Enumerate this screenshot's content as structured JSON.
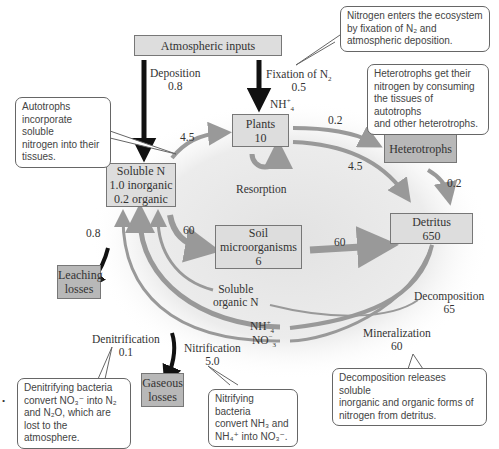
{
  "colors": {
    "box_fill": "#dddddd",
    "box_dark_fill": "#b8b8b8",
    "box_border": "#777777",
    "flow_gray": "#999999",
    "flow_black": "#111111",
    "glow": "#e6e6e6"
  },
  "boxes": {
    "atmospheric": {
      "label": "Atmospheric inputs"
    },
    "plants": {
      "line1": "Plants",
      "line2": "10"
    },
    "heterotrophs": {
      "label": "Heterotrophs"
    },
    "soluble_n": {
      "line1": "Soluble N",
      "line2": "1.0 inorganic",
      "line3": "0.2 organic"
    },
    "soil_micro": {
      "line1": "Soil",
      "line2": "microorganisms",
      "line3": "6"
    },
    "detritus": {
      "line1": "Detritus",
      "line2": "650"
    },
    "leaching": {
      "line1": "Leaching",
      "line2": "losses"
    },
    "gaseous": {
      "line1": "Gaseous",
      "line2": "losses"
    }
  },
  "flows": {
    "deposition": {
      "name": "Deposition",
      "value": "0.8"
    },
    "fixation": {
      "name": "Fixation of N",
      "sub": "2",
      "value": "0.5"
    },
    "nh4_label": {
      "text": "NH",
      "sub": "4",
      "sup": "+"
    },
    "soluble_to_plants": "4.5",
    "plants_to_heterotrophs": "0.2",
    "plants_to_detritus": "4.5",
    "heterotrophs_to_detritus": "0.2",
    "resorption": "Resorption",
    "soluble_to_soil": "60",
    "soil_to_detritus": "60",
    "leaching": "0.8",
    "soluble_organic": {
      "line1": "Soluble",
      "line2": "organic N"
    },
    "nh4": {
      "text": "NH",
      "sub": "4",
      "sup": "+"
    },
    "no3": {
      "text": "NO",
      "sub": "3",
      "sup": "−"
    },
    "decomposition": {
      "name": "Decomposition",
      "value": "65"
    },
    "mineralization": {
      "name": "Mineralization",
      "value": "60"
    },
    "denitrification": {
      "name": "Denitrification",
      "value": "0.1"
    },
    "nitrification": {
      "name": "Nitrification",
      "value": "5.0"
    }
  },
  "callouts": {
    "nitrogen_enters": {
      "lines": [
        "Nitrogen enters the ecosystem",
        "by fixation of N₂ and",
        "atmospheric deposition."
      ]
    },
    "heterotrophs": {
      "lines": [
        "Heterotrophs get their",
        "nitrogen by consuming",
        "the tissues of autotrophs",
        "and other heterotrophs."
      ]
    },
    "autotrophs": {
      "lines": [
        "Autotrophs",
        "incorporate soluble",
        "nitrogen into their",
        "tissues."
      ]
    },
    "denitrifying": {
      "lines": [
        "Denitrifying bacteria",
        "convert NO₃⁻ into N₂",
        "and N₂O, which are",
        "lost to the atmosphere."
      ]
    },
    "nitrifying": {
      "lines": [
        "Nitrifying bacteria",
        "convert NH₃ and",
        "NH₄⁺ into NO₃⁻."
      ]
    },
    "decomposition": {
      "lines": [
        "Decomposition releases soluble",
        "inorganic and organic forms of",
        "nitrogen from detritus."
      ]
    }
  },
  "margin_mark": "•"
}
